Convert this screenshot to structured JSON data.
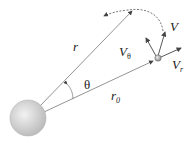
{
  "diagram": {
    "labels": {
      "r": "r",
      "r0_main": "r",
      "r0_sub": "0",
      "theta": "θ",
      "v": "V",
      "vtheta_main": "V",
      "vtheta_sub": "θ",
      "vr_main": "V",
      "vr_sub": "r"
    },
    "colors": {
      "line": "#666666",
      "planet": "#d8d8d8",
      "text": "#222222"
    }
  }
}
